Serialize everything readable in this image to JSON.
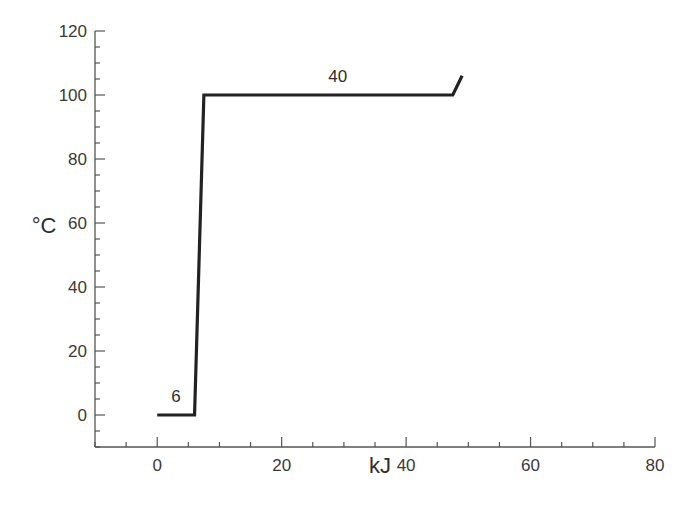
{
  "chart_data": {
    "type": "line",
    "title": "",
    "xlabel": "kJ",
    "ylabel": "°C",
    "xlim": [
      -10,
      80
    ],
    "ylim": [
      -10,
      120
    ],
    "grid": false,
    "legend": null,
    "x_ticks": [
      0,
      20,
      40,
      60,
      80
    ],
    "x_tick_labels": [
      "0",
      "20",
      "40",
      "60",
      "80"
    ],
    "y_ticks": [
      0,
      20,
      40,
      60,
      80,
      100,
      120
    ],
    "y_tick_labels": [
      "0",
      "20",
      "40",
      "60",
      "80",
      "100",
      "120"
    ],
    "series": [
      {
        "name": "heating curve",
        "color": "#222222",
        "x": [
          0,
          6,
          7.5,
          47.5,
          49
        ],
        "y": [
          0,
          0,
          100,
          100,
          106
        ]
      }
    ],
    "annotations": [
      {
        "text": "6",
        "x": 3,
        "y": 4
      },
      {
        "text": "40",
        "x": 29,
        "y": 104
      }
    ]
  }
}
